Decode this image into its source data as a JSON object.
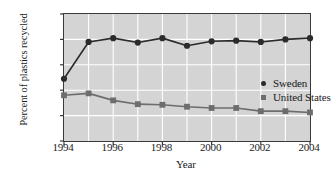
{
  "chart_data": {
    "type": "line",
    "title": "",
    "xlabel": "Year",
    "ylabel": "Percent of plastics recycled",
    "x": [
      1994,
      1995,
      1996,
      1997,
      1998,
      1999,
      2000,
      2001,
      2002,
      2003,
      2004
    ],
    "xlim": [
      1994,
      2004
    ],
    "ylim": [
      0,
      100
    ],
    "xticks": [
      "1994",
      "1996",
      "1998",
      "2000",
      "2002",
      "2004"
    ],
    "xtick_values": [
      1994,
      1996,
      1998,
      2000,
      2002,
      2004
    ],
    "yticks": [
      "0",
      "20",
      "40",
      "60",
      "80",
      "100"
    ],
    "ytick_values": [
      0,
      20,
      40,
      60,
      80,
      100
    ],
    "grid": true,
    "grid_color": "#ffffff",
    "plot_background": "#d4d4d4",
    "legend_position": "center-right",
    "series": [
      {
        "name": "Sweden",
        "marker": "circle",
        "color": "#2b2b2b",
        "values": [
          49,
          78,
          81,
          77.5,
          81,
          75,
          78.5,
          79,
          78,
          80,
          81
        ]
      },
      {
        "name": "United States",
        "marker": "square",
        "color": "#6d6d6d",
        "values": [
          36,
          37.5,
          32,
          29,
          28.5,
          27,
          26,
          26,
          23.5,
          23.5,
          22.5
        ]
      }
    ]
  }
}
